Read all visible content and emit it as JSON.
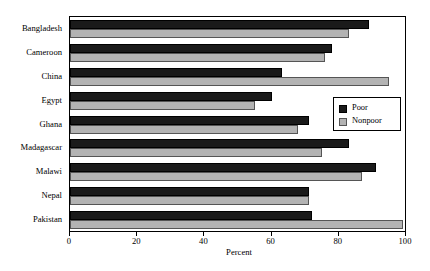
{
  "chart_data": {
    "type": "bar",
    "orientation": "horizontal",
    "title": "",
    "xlabel": "Percent",
    "ylabel": "",
    "xlim": [
      0,
      100
    ],
    "xticks": [
      0,
      20,
      40,
      60,
      80,
      100
    ],
    "grid": false,
    "legend_position": "center-right",
    "categories": [
      "Bangladesh",
      "Cameroon",
      "China",
      "Egypt",
      "Ghana",
      "Madagascar",
      "Malawi",
      "Nepal",
      "Pakistan"
    ],
    "series": [
      {
        "name": "Poor",
        "color": "#1a1a1a",
        "values": [
          89,
          78,
          63,
          60,
          71,
          83,
          91,
          71,
          72
        ]
      },
      {
        "name": "Nonpoor",
        "color": "#b3b3b3",
        "values": [
          83,
          76,
          95,
          55,
          68,
          75,
          87,
          71,
          99
        ]
      }
    ]
  }
}
